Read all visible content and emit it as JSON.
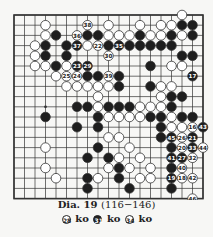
{
  "diagram": {
    "grid": {
      "cols": 19,
      "rows": 19,
      "x0": 14,
      "y0": 15,
      "dx": 10.5,
      "dy": 10.2
    },
    "hoshi": [
      [
        3,
        9
      ]
    ],
    "stones": [
      {
        "c": 16,
        "r": 0,
        "color": "w"
      },
      {
        "c": 3,
        "r": 1,
        "color": "w"
      },
      {
        "c": 7,
        "r": 1,
        "color": "w",
        "n": "38"
      },
      {
        "c": 9,
        "r": 1,
        "color": "w"
      },
      {
        "c": 12,
        "r": 1,
        "color": "w"
      },
      {
        "c": 14,
        "r": 1,
        "color": "w"
      },
      {
        "c": 15,
        "r": 1,
        "color": "w"
      },
      {
        "c": 16,
        "r": 1,
        "color": "b"
      },
      {
        "c": 17,
        "r": 1,
        "color": "b"
      },
      {
        "c": 3,
        "r": 2,
        "color": "w"
      },
      {
        "c": 4,
        "r": 2,
        "color": "b"
      },
      {
        "c": 6,
        "r": 2,
        "color": "w",
        "n": "36"
      },
      {
        "c": 7,
        "r": 2,
        "color": "b"
      },
      {
        "c": 8,
        "r": 2,
        "color": "b"
      },
      {
        "c": 9,
        "r": 2,
        "color": "w"
      },
      {
        "c": 10,
        "r": 2,
        "color": "w"
      },
      {
        "c": 11,
        "r": 2,
        "color": "w"
      },
      {
        "c": 12,
        "r": 2,
        "color": "b"
      },
      {
        "c": 13,
        "r": 2,
        "color": "w"
      },
      {
        "c": 14,
        "r": 2,
        "color": "w"
      },
      {
        "c": 15,
        "r": 2,
        "color": "b"
      },
      {
        "c": 16,
        "r": 2,
        "color": "w"
      },
      {
        "c": 17,
        "r": 2,
        "color": "b"
      },
      {
        "c": 2,
        "r": 3,
        "color": "w"
      },
      {
        "c": 3,
        "r": 3,
        "color": "b"
      },
      {
        "c": 5,
        "r": 3,
        "color": "b"
      },
      {
        "c": 6,
        "r": 3,
        "color": "b",
        "n": "37"
      },
      {
        "c": 7,
        "r": 3,
        "color": "w"
      },
      {
        "c": 8,
        "r": 3,
        "color": "w",
        "n": "22"
      },
      {
        "c": 9,
        "r": 3,
        "color": "b"
      },
      {
        "c": 10,
        "r": 3,
        "color": "b",
        "n": "35"
      },
      {
        "c": 11,
        "r": 3,
        "color": "b"
      },
      {
        "c": 12,
        "r": 3,
        "color": "b"
      },
      {
        "c": 13,
        "r": 3,
        "color": "b"
      },
      {
        "c": 14,
        "r": 3,
        "color": "b"
      },
      {
        "c": 15,
        "r": 3,
        "color": "b"
      },
      {
        "c": 2,
        "r": 4,
        "color": "w"
      },
      {
        "c": 3,
        "r": 4,
        "color": "b"
      },
      {
        "c": 5,
        "r": 4,
        "color": "b"
      },
      {
        "c": 9,
        "r": 4,
        "color": "w",
        "n": "30"
      },
      {
        "c": 16,
        "r": 4,
        "color": "b"
      },
      {
        "c": 17,
        "r": 4,
        "color": "b"
      },
      {
        "c": 2,
        "r": 5,
        "color": "w"
      },
      {
        "c": 3,
        "r": 5,
        "color": "w"
      },
      {
        "c": 4,
        "r": 5,
        "color": "b"
      },
      {
        "c": 5,
        "r": 5,
        "color": "w"
      },
      {
        "c": 6,
        "r": 5,
        "color": "b",
        "n": "23"
      },
      {
        "c": 7,
        "r": 5,
        "color": "b",
        "n": "29"
      },
      {
        "c": 13,
        "r": 5,
        "color": "b"
      },
      {
        "c": 15,
        "r": 5,
        "color": "w"
      },
      {
        "c": 16,
        "r": 5,
        "color": "w"
      },
      {
        "c": 4,
        "r": 6,
        "color": "w"
      },
      {
        "c": 5,
        "r": 6,
        "color": "w",
        "n": "25"
      },
      {
        "c": 6,
        "r": 6,
        "color": "w",
        "n": "24"
      },
      {
        "c": 7,
        "r": 6,
        "color": "b"
      },
      {
        "c": 8,
        "r": 6,
        "color": "b"
      },
      {
        "c": 9,
        "r": 6,
        "color": "w",
        "n": "39"
      },
      {
        "c": 10,
        "r": 6,
        "color": "b"
      },
      {
        "c": 17,
        "r": 6,
        "color": "b",
        "n": "17"
      },
      {
        "c": 5,
        "r": 7,
        "color": "w"
      },
      {
        "c": 6,
        "r": 7,
        "color": "w"
      },
      {
        "c": 7,
        "r": 7,
        "color": "w"
      },
      {
        "c": 8,
        "r": 7,
        "color": "w"
      },
      {
        "c": 9,
        "r": 7,
        "color": "w"
      },
      {
        "c": 10,
        "r": 7,
        "color": "b"
      },
      {
        "c": 13,
        "r": 7,
        "color": "b"
      },
      {
        "c": 14,
        "r": 7,
        "color": "w"
      },
      {
        "c": 15,
        "r": 7,
        "color": "w"
      },
      {
        "c": 8,
        "r": 8,
        "color": "w"
      },
      {
        "c": 14,
        "r": 8,
        "color": "w"
      },
      {
        "c": 15,
        "r": 8,
        "color": "b"
      },
      {
        "c": 16,
        "r": 8,
        "color": "b"
      },
      {
        "c": 6,
        "r": 9,
        "color": "b"
      },
      {
        "c": 7,
        "r": 9,
        "color": "b"
      },
      {
        "c": 8,
        "r": 9,
        "color": "w"
      },
      {
        "c": 9,
        "r": 9,
        "color": "b"
      },
      {
        "c": 10,
        "r": 9,
        "color": "b"
      },
      {
        "c": 11,
        "r": 9,
        "color": "b"
      },
      {
        "c": 12,
        "r": 9,
        "color": "w"
      },
      {
        "c": 13,
        "r": 9,
        "color": "w"
      },
      {
        "c": 14,
        "r": 9,
        "color": "w"
      },
      {
        "c": 15,
        "r": 9,
        "color": "b"
      },
      {
        "c": 3,
        "r": 10,
        "color": "b"
      },
      {
        "c": 8,
        "r": 10,
        "color": "b"
      },
      {
        "c": 9,
        "r": 10,
        "color": "w"
      },
      {
        "c": 10,
        "r": 10,
        "color": "w"
      },
      {
        "c": 11,
        "r": 10,
        "color": "w"
      },
      {
        "c": 12,
        "r": 10,
        "color": "w"
      },
      {
        "c": 13,
        "r": 10,
        "color": "b"
      },
      {
        "c": 14,
        "r": 10,
        "color": "b"
      },
      {
        "c": 15,
        "r": 10,
        "color": "w"
      },
      {
        "c": 16,
        "r": 10,
        "color": "b"
      },
      {
        "c": 17,
        "r": 10,
        "color": "b"
      },
      {
        "c": 6,
        "r": 11,
        "color": "b"
      },
      {
        "c": 8,
        "r": 11,
        "color": "b"
      },
      {
        "c": 14,
        "r": 11,
        "color": "b"
      },
      {
        "c": 15,
        "r": 11,
        "color": "w"
      },
      {
        "c": 16,
        "r": 11,
        "color": "w"
      },
      {
        "c": 17,
        "r": 11,
        "color": "w",
        "n": "16"
      },
      {
        "c": 18,
        "r": 11,
        "color": "b",
        "n": "43"
      },
      {
        "c": 9,
        "r": 12,
        "color": "w"
      },
      {
        "c": 10,
        "r": 12,
        "color": "w"
      },
      {
        "c": 14,
        "r": 12,
        "color": "b"
      },
      {
        "c": 15,
        "r": 12,
        "color": "b",
        "n": "45"
      },
      {
        "c": 16,
        "r": 12,
        "color": "w",
        "n": "26"
      },
      {
        "c": 17,
        "r": 12,
        "color": "b",
        "n": "21"
      },
      {
        "c": 3,
        "r": 13,
        "color": "w"
      },
      {
        "c": 8,
        "r": 13,
        "color": "b"
      },
      {
        "c": 11,
        "r": 13,
        "color": "w"
      },
      {
        "c": 15,
        "r": 13,
        "color": "b"
      },
      {
        "c": 16,
        "r": 13,
        "color": "w",
        "n": "20"
      },
      {
        "c": 17,
        "r": 13,
        "color": "b",
        "n": "33"
      },
      {
        "c": 18,
        "r": 13,
        "color": "w",
        "n": "44"
      },
      {
        "c": 7,
        "r": 14,
        "color": "b"
      },
      {
        "c": 9,
        "r": 14,
        "color": "b"
      },
      {
        "c": 10,
        "r": 14,
        "color": "w"
      },
      {
        "c": 12,
        "r": 14,
        "color": "w"
      },
      {
        "c": 15,
        "r": 14,
        "color": "b",
        "n": "41"
      },
      {
        "c": 16,
        "r": 14,
        "color": "b",
        "n": "27"
      },
      {
        "c": 17,
        "r": 14,
        "color": "w",
        "n": "32"
      },
      {
        "c": 3,
        "r": 15,
        "color": "w"
      },
      {
        "c": 9,
        "r": 15,
        "color": "w"
      },
      {
        "c": 10,
        "r": 15,
        "color": "b"
      },
      {
        "c": 11,
        "r": 15,
        "color": "w"
      },
      {
        "c": 13,
        "r": 15,
        "color": "w"
      },
      {
        "c": 15,
        "r": 15,
        "color": "b"
      },
      {
        "c": 16,
        "r": 15,
        "color": "w",
        "n": "40"
      },
      {
        "c": 4,
        "r": 16,
        "color": "w"
      },
      {
        "c": 7,
        "r": 16,
        "color": "b"
      },
      {
        "c": 8,
        "r": 16,
        "color": "w"
      },
      {
        "c": 10,
        "r": 16,
        "color": "b"
      },
      {
        "c": 12,
        "r": 16,
        "color": "w"
      },
      {
        "c": 13,
        "r": 16,
        "color": "w"
      },
      {
        "c": 15,
        "r": 16,
        "color": "b",
        "n": "19"
      },
      {
        "c": 16,
        "r": 16,
        "color": "w",
        "n": "18"
      },
      {
        "c": 17,
        "r": 16,
        "color": "w",
        "n": "42"
      },
      {
        "c": 7,
        "r": 17,
        "color": "b"
      },
      {
        "c": 11,
        "r": 17,
        "color": "b"
      },
      {
        "c": 15,
        "r": 17,
        "color": "b"
      },
      {
        "c": 17,
        "r": 18,
        "color": "w",
        "n": "46"
      }
    ]
  },
  "caption": {
    "title": "Dia. 19",
    "range": "(116−146)",
    "notes": [
      {
        "n": "28",
        "color": "w",
        "text": "ko"
      },
      {
        "n": "31",
        "color": "b",
        "text": "ko"
      },
      {
        "n": "34",
        "color": "w",
        "text": "ko"
      }
    ]
  },
  "colors": {
    "line": "#333333",
    "black": "#1e1e1e",
    "white": "#ffffff",
    "paper": "#f7f7f5"
  }
}
